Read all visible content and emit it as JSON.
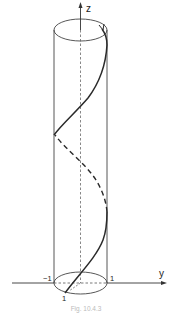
{
  "figure": {
    "axes": {
      "z_label": "z",
      "y_label": "y"
    },
    "ticks": {
      "y_neg": "−1",
      "y_pos": "1",
      "x_pos": "1"
    },
    "caption": "Fig. 10.4.3",
    "colors": {
      "stroke": "#333333",
      "helix": "#2a2a2a",
      "background": "#ffffff"
    }
  }
}
